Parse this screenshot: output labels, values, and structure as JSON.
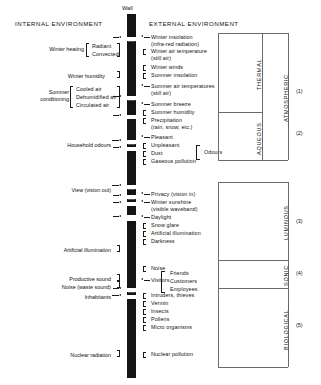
{
  "headers": {
    "internal": "INTERNAL ENVIRONMENT",
    "external": "EXTERNAL ENVIRONMENT",
    "wall": "Wall"
  },
  "internal_groups": [
    {
      "label": "Winter heating",
      "items": [
        "Radiant",
        "Convected"
      ]
    },
    {
      "label": "Winter humidity",
      "items": []
    },
    {
      "label": "Summer conditioning",
      "label_line1": "Summer",
      "label_line2": "conditioning",
      "items": [
        "Cooled air",
        "Dehumidified air",
        "Circulated air"
      ]
    },
    {
      "label": "Household odours",
      "items": []
    },
    {
      "label": "View (vision out)",
      "items": []
    },
    {
      "label": "Artificial illumination",
      "items": []
    },
    {
      "label": "Productive sound",
      "items": []
    },
    {
      "label": "Noise (waste sound)",
      "items": []
    },
    {
      "label": "Inhabitants",
      "items": []
    },
    {
      "label": "Nuclear radiation",
      "items": []
    }
  ],
  "external_items": [
    {
      "text": "Winter insolation",
      "dir": "in"
    },
    {
      "text": "(infra-red radiation)",
      "dir": "none"
    },
    {
      "text": "Winter air temperature",
      "dir": "hook"
    },
    {
      "text": "(still air)",
      "dir": "none"
    },
    {
      "text": "Winter winds",
      "dir": "hook"
    },
    {
      "text": "Summer insolation",
      "dir": "hook"
    },
    {
      "text": "Summer air temperatures",
      "dir": "in"
    },
    {
      "text": "(still air)",
      "dir": "none"
    },
    {
      "text": "Summer breeze",
      "dir": "in"
    },
    {
      "text": "Summer humidity",
      "dir": "hook"
    },
    {
      "text": "Precipitation",
      "dir": "hook"
    },
    {
      "text": "(rain, snow, etc.)",
      "dir": "none"
    },
    {
      "text": "Pleasant",
      "dir": "in"
    },
    {
      "text": "Unpleasant",
      "dir": "hook"
    },
    {
      "text": "Dust",
      "dir": "hook"
    },
    {
      "text": "Gaseous pollution",
      "dir": "hook"
    },
    {
      "text": "Privacy (vision in)",
      "dir": "in"
    },
    {
      "text": "Winter sunshine",
      "dir": "in"
    },
    {
      "text": "(visible waveband)",
      "dir": "none"
    },
    {
      "text": "Daylight",
      "dir": "in"
    },
    {
      "text": "Snow glare",
      "dir": "hook"
    },
    {
      "text": "Artificial illumination",
      "dir": "hook"
    },
    {
      "text": "Darkness",
      "dir": "hook"
    },
    {
      "text": "Noise",
      "dir": "hook"
    },
    {
      "text": "Visitors",
      "dir": "in"
    },
    {
      "text": "Intruders, thieves",
      "dir": "hook"
    },
    {
      "text": "Vermin",
      "dir": "hook"
    },
    {
      "text": "Insects",
      "dir": "hook"
    },
    {
      "text": "Pollens",
      "dir": "hook"
    },
    {
      "text": "Micro organisms",
      "dir": "hook"
    },
    {
      "text": "Nuclear pollution",
      "dir": "hook"
    }
  ],
  "odours_brace": {
    "label": "Odours",
    "items": [
      "Pleasant",
      "Unpleasant"
    ]
  },
  "visitors_brace": {
    "items": [
      "Friends",
      "Customers",
      "Employees"
    ]
  },
  "categories": [
    {
      "label": "THERMAL",
      "number": ""
    },
    {
      "label": "AQUEOUS",
      "number": ""
    },
    {
      "label": "ATMOSPHERIC",
      "number": "(1)"
    },
    {
      "label": "",
      "number": "(2)"
    },
    {
      "label": "LUMINOUS",
      "number": "(3)"
    },
    {
      "label": "SONIC",
      "number": "(4)"
    },
    {
      "label": "BIOLOGICAL",
      "number": "(5)"
    }
  ],
  "colors": {
    "wall": "#141414",
    "ink": "#1a1a1a",
    "rule": "#6a6a6a",
    "background": "#ffffff"
  }
}
